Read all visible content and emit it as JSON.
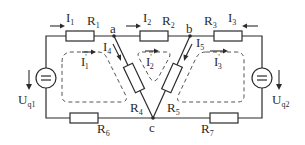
{
  "diagram": {
    "type": "electrical-circuit",
    "nodes": {
      "a": "a",
      "b": "b",
      "c": "c"
    },
    "resistors": [
      {
        "id": "R1",
        "label": "R",
        "sub": "1"
      },
      {
        "id": "R2",
        "label": "R",
        "sub": "2"
      },
      {
        "id": "R3",
        "label": "R",
        "sub": "3"
      },
      {
        "id": "R4",
        "label": "R",
        "sub": "4"
      },
      {
        "id": "R5",
        "label": "R",
        "sub": "5"
      },
      {
        "id": "R6",
        "label": "R",
        "sub": "6"
      },
      {
        "id": "R7",
        "label": "R",
        "sub": "7"
      }
    ],
    "branch_currents": [
      {
        "id": "I1",
        "label": "I",
        "sub": "1"
      },
      {
        "id": "I2",
        "label": "I",
        "sub": "2"
      },
      {
        "id": "I3",
        "label": "I",
        "sub": "3"
      },
      {
        "id": "I4",
        "label": "I",
        "sub": "4"
      },
      {
        "id": "I5",
        "label": "I",
        "sub": "5"
      }
    ],
    "loop_currents": [
      {
        "id": "I'1",
        "label": "I",
        "prime": "'",
        "sub": "1"
      },
      {
        "id": "I'2",
        "label": "I",
        "prime": "'",
        "sub": "2"
      },
      {
        "id": "I'3",
        "label": "I",
        "prime": "'",
        "sub": "3"
      }
    ],
    "sources": [
      {
        "id": "Uq1",
        "label": "U",
        "sub": "q1",
        "symbol": "="
      },
      {
        "id": "Uq2",
        "label": "U",
        "sub": "q2",
        "symbol": "="
      }
    ]
  }
}
